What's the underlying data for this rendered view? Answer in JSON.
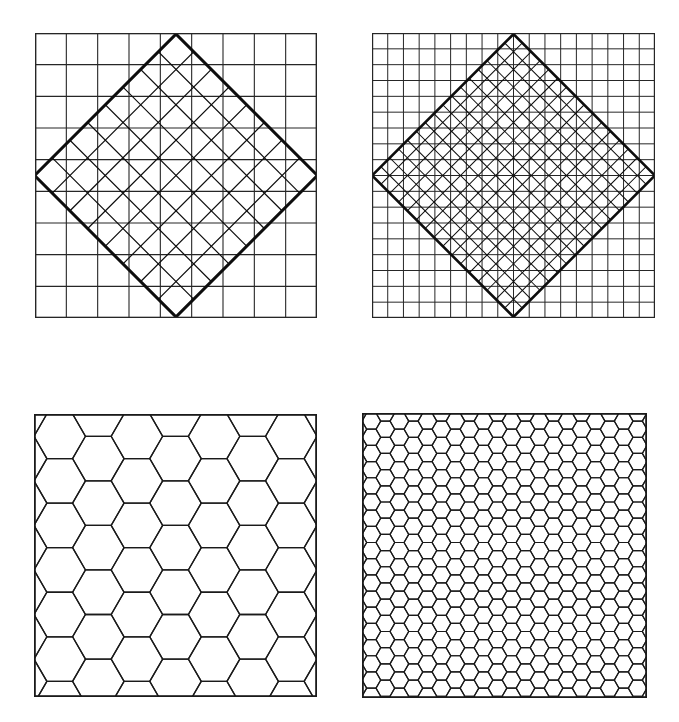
{
  "figure": {
    "title": "",
    "background_color": "#ffffff",
    "stroke_color": "#1a1a1a",
    "width": 679,
    "height": 722
  },
  "chart_data": {
    "type": "diagram",
    "title": "",
    "subtitle": "",
    "xlabel": "",
    "ylabel": "",
    "grid": false,
    "legend": "none",
    "panel_count": 4,
    "panels": [
      {
        "id": "panel-top-left",
        "label": "",
        "position": {
          "x": 35,
          "y": 33,
          "width": 282,
          "height": 285
        },
        "pattern": "square-grid-with-rotated-square-overlay",
        "base_grid": {
          "type": "square",
          "columns": 9,
          "rows": 9,
          "cell_size": 31.3,
          "line_width": 1.1,
          "color": "#262626"
        },
        "overlay": {
          "type": "rotated-square-grid",
          "rotation_deg": 45,
          "columns": 8,
          "rows": 8,
          "cell_size": 25.0,
          "line_width": 1.2,
          "border_width": 3.0,
          "color": "#0d0d0d",
          "center": {
            "x": 176,
            "y": 175.5
          }
        }
      },
      {
        "id": "panel-top-right",
        "label": "",
        "position": {
          "x": 372,
          "y": 33,
          "width": 283,
          "height": 285
        },
        "pattern": "square-grid-with-rotated-square-overlay",
        "base_grid": {
          "type": "square",
          "columns": 18,
          "rows": 18,
          "cell_size": 15.7,
          "line_width": 1.0,
          "color": "#262626"
        },
        "overlay": {
          "type": "rotated-square-grid",
          "rotation_deg": 45,
          "columns": 16,
          "rows": 16,
          "cell_size": 12.5,
          "line_width": 1.0,
          "border_width": 2.6,
          "color": "#0d0d0d",
          "center": {
            "x": 513.5,
            "y": 175.5
          }
        }
      },
      {
        "id": "panel-bottom-left",
        "label": "",
        "position": {
          "x": 34,
          "y": 414,
          "width": 283,
          "height": 283
        },
        "pattern": "hexagonal-tessellation",
        "hex_grid": {
          "type": "hexagon",
          "orientation": "flat-top",
          "columns": 7,
          "rows": 7,
          "hex_radius": 22.0,
          "line_width": 1.3,
          "color": "#1a1a1a"
        },
        "border_width": 1.8
      },
      {
        "id": "panel-bottom-right",
        "label": "",
        "position": {
          "x": 362,
          "y": 413,
          "width": 285,
          "height": 285
        },
        "pattern": "hexagonal-tessellation",
        "hex_grid": {
          "type": "hexagon",
          "orientation": "flat-top",
          "columns": 20,
          "rows": 20,
          "hex_radius": 7.7,
          "line_width": 1.2,
          "color": "#1a1a1a"
        },
        "border_width": 1.8
      }
    ]
  }
}
